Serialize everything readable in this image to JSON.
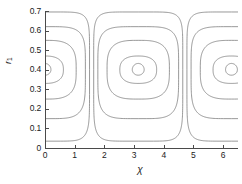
{
  "figure": {
    "background": "#ffffff",
    "line_color": "#6d6d6d",
    "axis_color": "#4a4a4a"
  },
  "axes": {
    "xlabel": "χ",
    "ylabel_base": "r",
    "ylabel_sub": "1",
    "x_ticks": [
      "0",
      "1",
      "2",
      "3",
      "4",
      "5",
      "6"
    ],
    "y_ticks": [
      "0",
      "0.1",
      "0.2",
      "0.3",
      "0.4",
      "0.5",
      "0.6",
      "0.7"
    ]
  },
  "chart_data": {
    "type": "line",
    "title": "",
    "xlabel": "χ",
    "ylabel": "r₁",
    "xlim": [
      0,
      6.5
    ],
    "ylim": [
      0,
      0.7
    ],
    "x_ticks": [
      0,
      1,
      2,
      3,
      4,
      5,
      6
    ],
    "y_ticks": [
      0,
      0.1,
      0.2,
      0.3,
      0.4,
      0.5,
      0.6,
      0.7
    ],
    "grid": false,
    "legend": null,
    "centers": [
      {
        "x": 0.0,
        "r1": 0.4
      },
      {
        "x": 3.14,
        "r1": 0.4
      },
      {
        "x": 6.28,
        "r1": 0.4
      }
    ],
    "series": [
      {
        "name": "contour-outer",
        "level_index": 4,
        "r1_top": 0.695,
        "r1_bottom": 0.035,
        "half_width_x": 1.5
      },
      {
        "name": "contour-2",
        "level_index": 3,
        "r1_top": 0.62,
        "r1_bottom": 0.15,
        "half_width_x": 1.36
      },
      {
        "name": "contour-3",
        "level_index": 2,
        "r1_top": 0.55,
        "r1_bottom": 0.25,
        "half_width_x": 1.05
      },
      {
        "name": "contour-4",
        "level_index": 1,
        "r1_top": 0.47,
        "r1_bottom": 0.33,
        "half_width_x": 0.62
      },
      {
        "name": "contour-inner",
        "level_index": 0,
        "r1_top": 0.432,
        "r1_bottom": 0.372,
        "half_width_x": 0.2
      }
    ]
  }
}
